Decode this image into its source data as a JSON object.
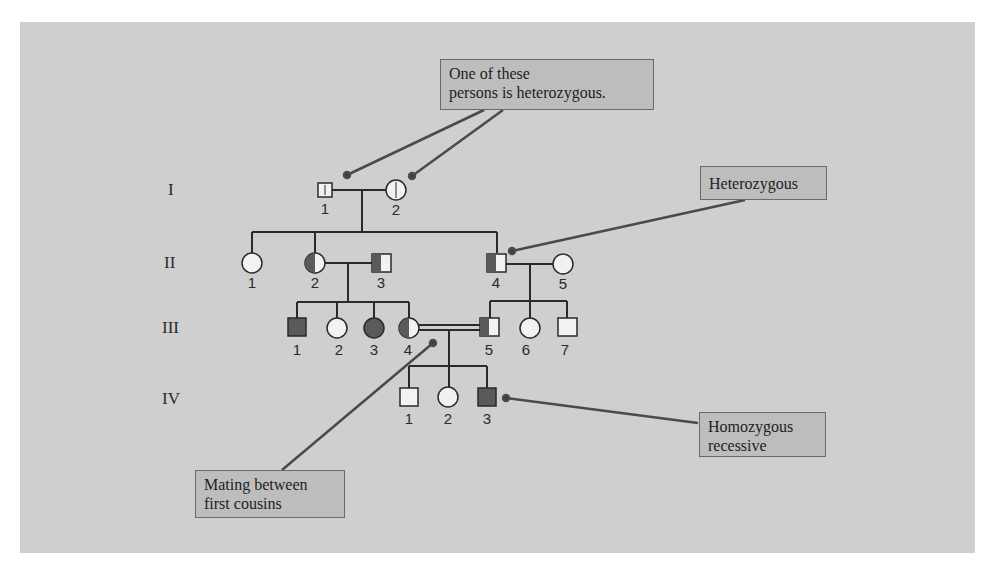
{
  "generations": [
    {
      "label": "I"
    },
    {
      "label": "II"
    },
    {
      "label": "III"
    },
    {
      "label": "IV"
    }
  ],
  "individuals": {
    "I": [
      {
        "id": "1",
        "sex": "male",
        "phenotype": "carrier-uncertain"
      },
      {
        "id": "2",
        "sex": "female",
        "phenotype": "carrier-uncertain"
      }
    ],
    "II": [
      {
        "id": "1",
        "sex": "female",
        "phenotype": "unaffected"
      },
      {
        "id": "2",
        "sex": "female",
        "phenotype": "heterozygous"
      },
      {
        "id": "3",
        "sex": "male",
        "phenotype": "heterozygous"
      },
      {
        "id": "4",
        "sex": "male",
        "phenotype": "heterozygous"
      },
      {
        "id": "5",
        "sex": "female",
        "phenotype": "unaffected"
      }
    ],
    "III": [
      {
        "id": "1",
        "sex": "male",
        "phenotype": "affected"
      },
      {
        "id": "2",
        "sex": "female",
        "phenotype": "unaffected"
      },
      {
        "id": "3",
        "sex": "female",
        "phenotype": "affected"
      },
      {
        "id": "4",
        "sex": "female",
        "phenotype": "heterozygous"
      },
      {
        "id": "5",
        "sex": "male",
        "phenotype": "heterozygous"
      },
      {
        "id": "6",
        "sex": "female",
        "phenotype": "unaffected"
      },
      {
        "id": "7",
        "sex": "male",
        "phenotype": "unaffected"
      }
    ],
    "IV": [
      {
        "id": "1",
        "sex": "male",
        "phenotype": "unaffected"
      },
      {
        "id": "2",
        "sex": "female",
        "phenotype": "unaffected"
      },
      {
        "id": "3",
        "sex": "male",
        "phenotype": "affected"
      }
    ]
  },
  "callouts": {
    "one_of_these": "One of these\npersons is heterozygous.",
    "heterozygous": "Heterozygous",
    "homozygous": "Homozygous\nrecessive",
    "mating": "Mating between\nfirst cousins"
  },
  "colors": {
    "background": "#cfcfcf",
    "affected": "#5a5a5a",
    "unaffected": "#f2f2f2",
    "line": "#2a2a2a",
    "callout_fill": "#bdbdbd"
  }
}
